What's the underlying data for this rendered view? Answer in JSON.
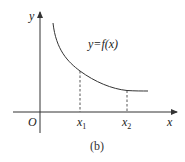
{
  "diagram": {
    "caption": "(b)",
    "axes": {
      "x_label": "x",
      "y_label": "y",
      "origin_label": "O"
    },
    "curve": {
      "label": "y=f(x)",
      "type": "decreasing convex curve"
    },
    "markers": [
      {
        "label_base": "x",
        "label_sub": "1"
      },
      {
        "label_base": "x",
        "label_sub": "2"
      }
    ],
    "colors": {
      "line": "#333333",
      "background": "#ffffff"
    }
  }
}
